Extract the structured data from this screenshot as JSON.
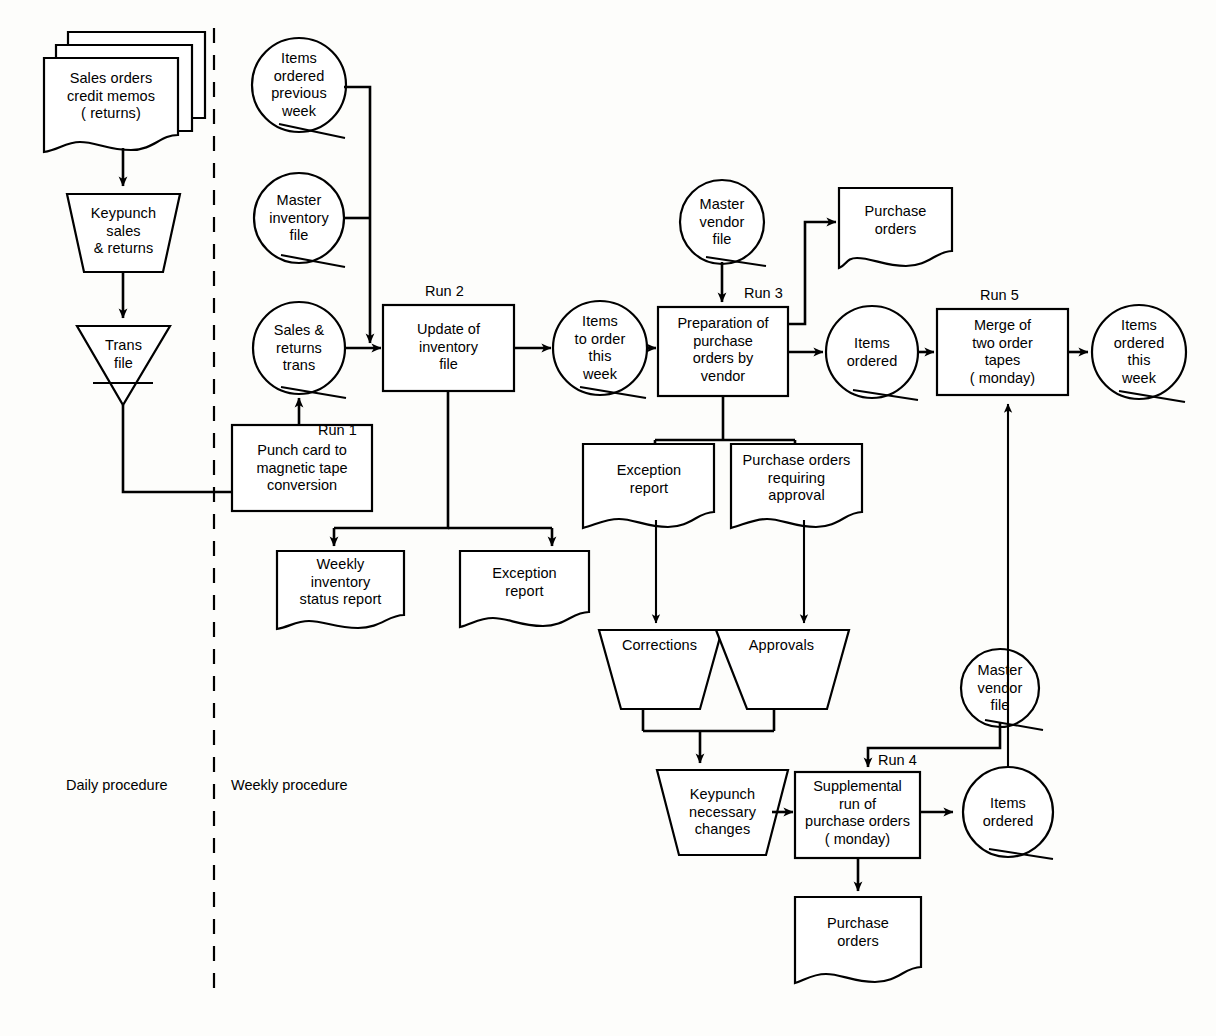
{
  "diagram": {
    "phase_labels": {
      "daily": "Daily procedure",
      "weekly": "Weekly procedure"
    },
    "run_labels": {
      "run1": "Run 1",
      "run2": "Run 2",
      "run3": "Run 3",
      "run4": "Run 4",
      "run5": "Run 5"
    },
    "nodes": {
      "sales_orders_doc": "Sales orders\ncredit memos\n( returns)",
      "keypunch_sales": "Keypunch\nsales\n& returns",
      "trans_file": "Trans\nfile",
      "items_ordered_prev_week": "Items\nordered\nprevious\nweek",
      "master_inventory_file": "Master\ninventory\nfile",
      "sales_returns_trans": "Sales &\nreturns\ntrans",
      "punch_card_conversion": "Punch card to\nmagnetic tape\nconversion",
      "update_inventory_file": "Update of\ninventory\nfile",
      "weekly_inventory_status_report": "Weekly\ninventory\nstatus report",
      "exception_report_run2": "Exception\nreport",
      "items_to_order_this_week": "Items\nto order\nthis\nweek",
      "master_vendor_file_top": "Master\nvendor\nfile",
      "preparation_purchase_orders": "Preparation of\npurchase\norders by\nvendor",
      "purchase_orders_top": "Purchase\norders",
      "items_ordered_run3": "Items\nordered",
      "merge_two_order_tapes": "Merge of\ntwo order\ntapes\n( monday)",
      "items_ordered_this_week": "Items\nordered\nthis\nweek",
      "exception_report_run3": "Exception\nreport",
      "purchase_orders_requiring_approval": "Purchase orders\nrequiring\napproval",
      "corrections": "Corrections",
      "approvals": "Approvals",
      "master_vendor_file_bottom": "Master\nvendor\nfile",
      "keypunch_necessary_changes": "Keypunch\nnecessary\nchanges",
      "supplemental_run": "Supplemental\nrun of\npurchase orders\n( monday)",
      "items_ordered_run4": "Items\nordered",
      "purchase_orders_bottom": "Purchase\norders"
    },
    "colors": {
      "stroke": "#000000",
      "fill": "#ffffff",
      "background": "#fdfdfb"
    },
    "page_top_text": ""
  }
}
